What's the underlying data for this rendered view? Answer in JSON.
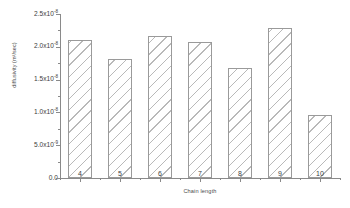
{
  "chart_data": {
    "type": "bar",
    "title": "",
    "xlabel": "Chain length",
    "ylabel": "diffusivity (m²/sec)",
    "categories": [
      "4",
      "5",
      "6",
      "7",
      "8",
      "9",
      "10"
    ],
    "values": [
      2.1e-08,
      1.82e-08,
      2.17e-08,
      2.08e-08,
      1.67e-08,
      2.28e-08,
      9.6e-09
    ],
    "ylim": [
      0,
      2.5e-08
    ],
    "xlim": [
      3.5,
      10.5
    ],
    "grid": false,
    "legend": null,
    "bar_style": {
      "fill": "#ffffff",
      "hatch": "diagonal",
      "hatch_color": "#b9b9b9",
      "edge_color": "#9a9a9a"
    },
    "y_ticks": [
      {
        "value": 0.0,
        "mantissa": "0.0",
        "exponent": ""
      },
      {
        "value": 5e-09,
        "mantissa": "5.0x10",
        "exponent": "-9"
      },
      {
        "value": 1e-08,
        "mantissa": "1.0x10",
        "exponent": "-8"
      },
      {
        "value": 1.5e-08,
        "mantissa": "1.5x10",
        "exponent": "-8"
      },
      {
        "value": 2e-08,
        "mantissa": "2.0x10",
        "exponent": "-8"
      },
      {
        "value": 2.5e-08,
        "mantissa": "2.5x10",
        "exponent": "-8"
      }
    ],
    "axis_color": "#8a8a8a",
    "text_color": "#3d3d3d",
    "background": "#ffffff"
  }
}
